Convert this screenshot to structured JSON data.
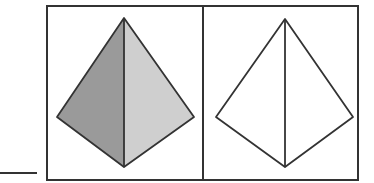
{
  "figure": {
    "colors": {
      "stroke": "#333333",
      "left_face_dark": "#9a9a9a",
      "right_face_light": "#cfcfcf",
      "background": "#ffffff"
    },
    "panels": [
      {
        "label": "shaded-pyramid",
        "fill": true
      },
      {
        "label": "outline-pyramid",
        "fill": false
      }
    ]
  }
}
